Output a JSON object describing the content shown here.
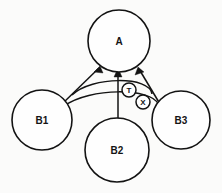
{
  "diagram": {
    "background_color": "#fbfbfa",
    "stroke_color": "#131313",
    "fill_color": "#fefefe",
    "nodes": [
      {
        "id": "A",
        "label": "A",
        "cx": 119,
        "cy": 41,
        "r": 31
      },
      {
        "id": "B1",
        "label": "B1",
        "cx": 42,
        "cy": 120,
        "r": 30
      },
      {
        "id": "B2",
        "label": "B2",
        "cx": 117,
        "cy": 150,
        "r": 32
      },
      {
        "id": "B3",
        "label": "B3",
        "cx": 181,
        "cy": 120,
        "r": 29
      }
    ],
    "mediators": [
      {
        "id": "T",
        "label": "T",
        "cx": 129,
        "cy": 90,
        "r": 7
      },
      {
        "id": "X",
        "label": "X",
        "cx": 143,
        "cy": 102,
        "r": 7
      }
    ],
    "edges": [
      {
        "id": "b1-to-a",
        "from": "B1",
        "to": "A",
        "arrow": true
      },
      {
        "id": "b2-to-a",
        "from": "B2",
        "to": "A",
        "arrow": true
      },
      {
        "id": "b3-to-a",
        "from": "B3",
        "to": "A",
        "arrow": true
      },
      {
        "id": "arc-upper",
        "from": "B1",
        "to": "B3",
        "arrow": false
      },
      {
        "id": "arc-lower",
        "from": "B1",
        "to": "B3",
        "arrow": false
      }
    ]
  }
}
